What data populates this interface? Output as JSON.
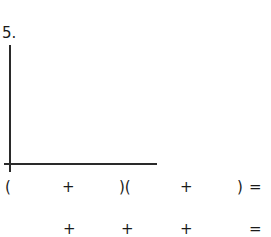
{
  "problem": {
    "number": "5.",
    "area_model": {
      "vertical_axis": true,
      "horizontal_axis": true
    },
    "row1": {
      "open_paren": "(",
      "plus1": "+",
      "mid_parens": ")(",
      "plus2": "+",
      "close_paren": ")",
      "equals": "="
    },
    "row2": {
      "plus1": "+",
      "plus2": "+",
      "plus3": "+",
      "equals": "="
    }
  }
}
